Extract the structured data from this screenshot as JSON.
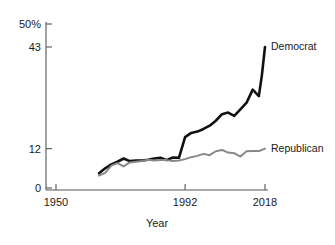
{
  "chart_data": {
    "type": "line",
    "title": "",
    "subtitle": "",
    "xlabel": "Year",
    "ylabel": "",
    "xlim": [
      1950,
      2018
    ],
    "ylim": [
      0,
      50
    ],
    "grid": false,
    "legend_position": "right-inline",
    "x_ticks": [
      1950,
      1992,
      2018
    ],
    "x_tick_labels": [
      "1950",
      "1992",
      "2018"
    ],
    "y_ticks": [
      0,
      12,
      43,
      50
    ],
    "y_tick_labels": [
      "0",
      "12",
      "43",
      "50%"
    ],
    "series": [
      {
        "name": "Democrat",
        "color": "#111111",
        "label": "Democrat",
        "x": [
          1964,
          1966,
          1968,
          1970,
          1972,
          1974,
          1976,
          1978,
          1980,
          1982,
          1984,
          1986,
          1988,
          1990,
          1992,
          1994,
          1996,
          1998,
          2000,
          2002,
          2004,
          2006,
          2008,
          2010,
          2012,
          2014,
          2016,
          2017,
          2018
        ],
        "values": [
          4.5,
          6.0,
          7.2,
          8.0,
          9.0,
          8.2,
          8.4,
          8.4,
          8.6,
          9.0,
          9.2,
          8.5,
          9.3,
          9.2,
          15.5,
          16.8,
          17.2,
          18.0,
          19.0,
          20.5,
          22.5,
          23.0,
          22.0,
          24.0,
          26.0,
          30.0,
          28.0,
          34.5,
          43.0
        ]
      },
      {
        "name": "Republican",
        "color": "#888888",
        "label": "Republican",
        "x": [
          1964,
          1966,
          1968,
          1970,
          1972,
          1974,
          1976,
          1978,
          1980,
          1982,
          1984,
          1986,
          1988,
          1990,
          1992,
          1994,
          1996,
          1998,
          2000,
          2002,
          2004,
          2006,
          2008,
          2010,
          2012,
          2014,
          2016,
          2017,
          2018
        ],
        "values": [
          3.8,
          4.6,
          6.8,
          7.6,
          6.6,
          7.8,
          8.0,
          8.2,
          8.6,
          8.4,
          8.5,
          8.5,
          8.2,
          8.4,
          8.8,
          9.4,
          9.8,
          10.4,
          10.0,
          11.2,
          11.6,
          10.8,
          10.6,
          9.6,
          11.2,
          11.3,
          11.3,
          11.6,
          12.0
        ]
      }
    ]
  },
  "axes": {
    "x_title": "Year",
    "y_suffix": "%"
  }
}
